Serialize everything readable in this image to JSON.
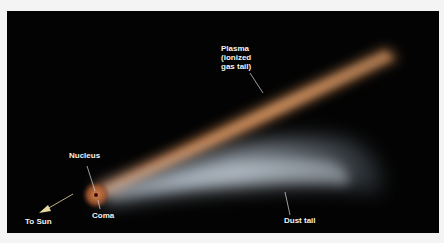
{
  "figure": {
    "background_color": "#030303",
    "labels": {
      "plasma_line1": "Plasma",
      "plasma_line2": "(ionized",
      "plasma_line3": "gas tail)",
      "nucleus": "Nucleus",
      "coma": "Coma",
      "to_sun": "To Sun",
      "dust_tail": "Dust tail"
    },
    "colors": {
      "plasma_tail": "#d9935a",
      "dust_tail": "#c8d4e0",
      "coma": "#c9703a",
      "nucleus": "#5a0a05",
      "arrow": "#e8d9a0",
      "label_text": "#f2f2f2"
    }
  }
}
